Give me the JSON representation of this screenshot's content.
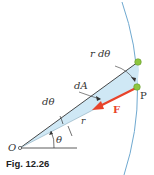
{
  "figure": {
    "caption": "Fig. 12.26",
    "labels": {
      "origin": "O",
      "point": "P",
      "force": "F",
      "arc_length": "r dθ",
      "area": "dA",
      "angle_increment": "dθ",
      "angle": "θ",
      "radius": "r"
    },
    "colors": {
      "sector_fill": "#cfe8f5",
      "arc": "#6fa9d0",
      "force_arrow": "#e8432a",
      "particle": "#8dc63f",
      "line": "#333333"
    }
  }
}
